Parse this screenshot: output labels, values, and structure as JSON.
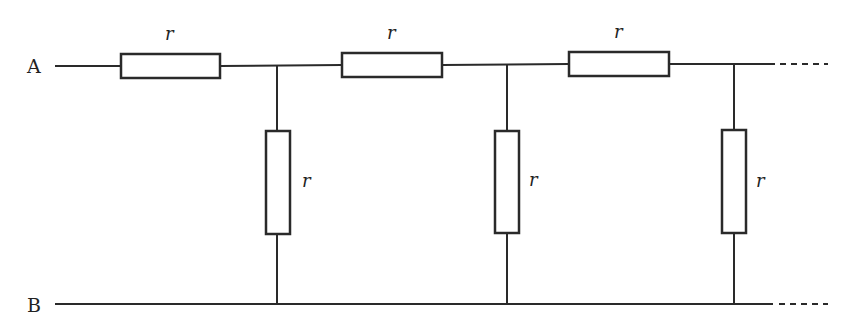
{
  "diagram": {
    "type": "infinite resistor ladder network",
    "terminals": [
      {
        "id": "A",
        "label": "A"
      },
      {
        "id": "B",
        "label": "B"
      }
    ],
    "series_resistors": [
      {
        "label": "r"
      },
      {
        "label": "r"
      },
      {
        "label": "r"
      }
    ],
    "shunt_resistors": [
      {
        "label": "r"
      },
      {
        "label": "r"
      },
      {
        "label": "r"
      }
    ],
    "continuation": "dashed lines indicate the ladder continues indefinitely"
  }
}
